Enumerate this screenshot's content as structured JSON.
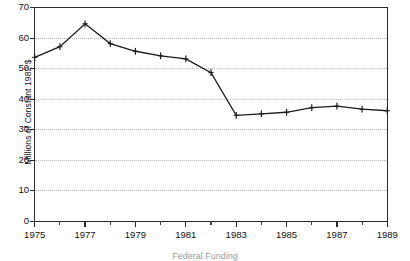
{
  "chart_data": {
    "type": "line",
    "title": "",
    "xlabel": "",
    "ylabel": "Millions of Constant 1982 $",
    "x": [
      1975,
      1976,
      1977,
      1978,
      1979,
      1980,
      1981,
      1982,
      1983,
      1984,
      1985,
      1986,
      1987,
      1988,
      1989
    ],
    "values": [
      53.5,
      57.0,
      64.5,
      58.0,
      55.5,
      54.0,
      53.0,
      48.5,
      34.5,
      35.0,
      35.5,
      37.0,
      37.5,
      36.5,
      36.0
    ],
    "series": [
      {
        "name": "Funding",
        "values": [
          53.5,
          57.0,
          64.5,
          58.0,
          55.5,
          54.0,
          53.0,
          48.5,
          34.5,
          35.0,
          35.5,
          37.0,
          37.5,
          36.5,
          36.0
        ]
      }
    ],
    "xlim": [
      1975,
      1989
    ],
    "ylim": [
      0,
      70
    ],
    "ytick_labels": [
      "0",
      "10",
      "20",
      "30",
      "40",
      "50",
      "60",
      "70"
    ],
    "ytick_values": [
      0,
      10,
      20,
      30,
      40,
      50,
      60,
      70
    ],
    "xtick_labels": [
      "1975",
      "1977",
      "1979",
      "1981",
      "1983",
      "1985",
      "1987",
      "1989"
    ],
    "xtick_values": [
      1975,
      1977,
      1979,
      1981,
      1983,
      1985,
      1987,
      1989
    ],
    "xtick_minor_values": [
      1976,
      1978,
      1980,
      1982,
      1984,
      1986,
      1988
    ],
    "grid": "horizontal-dotted",
    "legend": "none",
    "marker": "plus",
    "line_color": "#1b1b1b",
    "grid_color": "#b9b9b9",
    "axis_color": "#2b2b2b"
  },
  "caption": {
    "text": "Federal Funding"
  }
}
